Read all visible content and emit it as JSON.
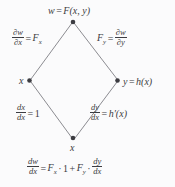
{
  "diagram": {
    "type": "tree-diagram-chain-rule",
    "background_color": "#fbfbfc",
    "ink_color": "#3c3c41",
    "nodes": {
      "top": {
        "label_plain": "w = F(x, y)",
        "w": "w",
        "eq": "=",
        "F": "F",
        "args": "(x, y)"
      },
      "left": {
        "label_plain": "x",
        "x": "x"
      },
      "right": {
        "label_plain": "y = h(x)",
        "y": "y",
        "eq": "=",
        "h": "h",
        "args": "(x)"
      },
      "bottom": {
        "label_plain": "x",
        "x": "x"
      }
    },
    "edge_labels": {
      "top_left": {
        "plain": "∂w/∂x = F_x",
        "num": "∂w",
        "den": "∂x",
        "eq": "=",
        "rhs_base": "F",
        "rhs_sub": "x"
      },
      "top_right": {
        "plain": "F_y = ∂w/∂y",
        "lhs_base": "F",
        "lhs_sub": "y",
        "eq": "=",
        "num": "∂w",
        "den": "∂y"
      },
      "bottom_left": {
        "plain": "dx/dx = 1",
        "num": "dx",
        "den": "dx",
        "eq": "=",
        "rhs": "1"
      },
      "bottom_right": {
        "plain": "dy/dx = h'(x)",
        "num": "dy",
        "den": "dx",
        "eq": "=",
        "rhs_base": "h",
        "rhs_prime": "′",
        "rhs_args": "(x)"
      }
    },
    "result_equation": {
      "plain": "dw/dx = F_x · 1 + F_y · dy/dx",
      "num": "dw",
      "den": "dx",
      "eq": "=",
      "t1_base": "F",
      "t1_sub": "x",
      "dot1": "·",
      "one": "1",
      "plus": "+",
      "t2_base": "F",
      "t2_sub": "y",
      "dot2": "·",
      "t3_num": "dy",
      "t3_den": "dx"
    }
  }
}
